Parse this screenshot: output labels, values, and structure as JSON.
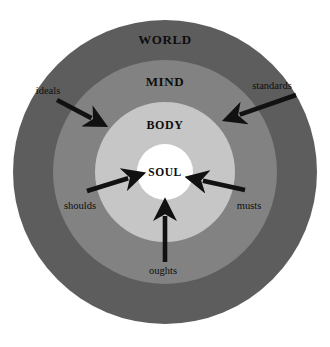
{
  "diagram": {
    "background_color": "#ffffff",
    "center": {
      "x": 165,
      "y": 172
    },
    "zones": [
      {
        "name": "world",
        "label": "WORLD",
        "color": "#5d5d5d",
        "radius": 152,
        "label_x": 165,
        "label_y": 40
      },
      {
        "name": "mind",
        "label": "MIND",
        "color": "#828282",
        "radius": 112,
        "label_x": 165,
        "label_y": 82
      },
      {
        "name": "body",
        "label": "BODY",
        "color": "#c6c6c6",
        "radius": 70,
        "label_x": 165,
        "label_y": 125
      },
      {
        "name": "soul",
        "label": "SOUL",
        "color": "#ffffff",
        "radius": 28,
        "label_x": 165,
        "label_y": 172
      }
    ],
    "arrows": [
      {
        "name": "ideals",
        "label": "ideals",
        "color": "#111111",
        "label_x": 48,
        "label_y": 90,
        "from_x": 57,
        "from_y": 100,
        "to_x": 95,
        "to_y": 120
      },
      {
        "name": "standards",
        "label": "standards",
        "color": "#111111",
        "label_x": 272,
        "label_y": 85,
        "from_x": 296,
        "from_y": 95,
        "to_x": 236,
        "to_y": 116
      },
      {
        "name": "shoulds",
        "label": "shoulds",
        "color": "#111111",
        "label_x": 80,
        "label_y": 205,
        "from_x": 87,
        "from_y": 191,
        "to_x": 132,
        "to_y": 177
      },
      {
        "name": "musts",
        "label": "musts",
        "color": "#111111",
        "label_x": 249,
        "label_y": 205,
        "from_x": 245,
        "from_y": 190,
        "to_x": 199,
        "to_y": 180
      },
      {
        "name": "oughts",
        "label": "oughts",
        "color": "#111111",
        "label_x": 163,
        "label_y": 270,
        "from_x": 165,
        "from_y": 262,
        "to_x": 165,
        "to_y": 212
      }
    ]
  }
}
